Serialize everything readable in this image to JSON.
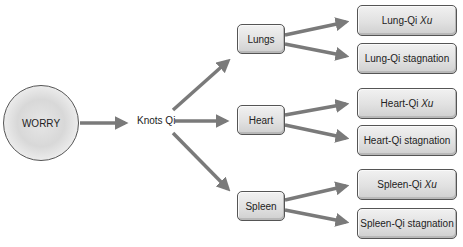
{
  "diagram": {
    "root": {
      "label": "WORRY"
    },
    "intermediate": {
      "label": "Knots Qi"
    },
    "organs": [
      {
        "label": "Lungs",
        "outcomes": [
          {
            "prefix": "Lung-Qi ",
            "suffix": "Xu",
            "suffix_italic": true
          },
          {
            "prefix": "Lung-Qi stagnation",
            "suffix": "",
            "suffix_italic": false
          }
        ]
      },
      {
        "label": "Heart",
        "outcomes": [
          {
            "prefix": "Heart-Qi ",
            "suffix": "Xu",
            "suffix_italic": true
          },
          {
            "prefix": "Heart-Qi stagnation",
            "suffix": "",
            "suffix_italic": false
          }
        ]
      },
      {
        "label": "Spleen",
        "outcomes": [
          {
            "prefix": "Spleen-Qi ",
            "suffix": "Xu",
            "suffix_italic": true
          },
          {
            "prefix": "Spleen-Qi stagnation",
            "suffix": "",
            "suffix_italic": false
          }
        ]
      }
    ],
    "colors": {
      "arrow": "#7a7a7a",
      "box_border": "#555555",
      "box_fill": "#e1e1e1",
      "text": "#222222"
    }
  }
}
